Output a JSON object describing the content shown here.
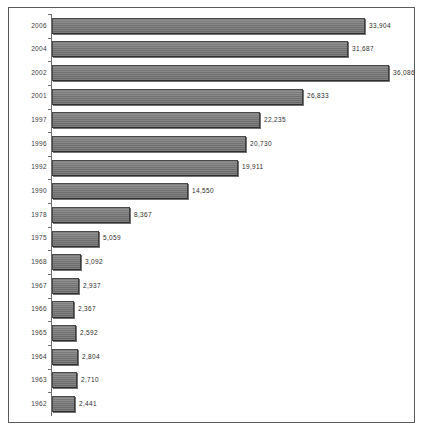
{
  "chart": {
    "type": "bar",
    "orientation": "horizontal",
    "title": "",
    "xlabel": "",
    "ylabel": "",
    "grid": false,
    "legend": false,
    "axis_tick_labels_visible": false,
    "bar_color": "#7a7a7a",
    "bar_border_color": "#4a4a4a",
    "frame_color": "#5a5a5a",
    "text_color": "#3b3b3b"
  },
  "chart_data": {
    "type": "bar",
    "orientation": "horizontal",
    "title": "",
    "xlabel": "",
    "ylabel": "",
    "grid": false,
    "legend_position": "none",
    "xlim": [
      0,
      36086
    ],
    "categories": [
      "2006",
      "2004",
      "2002",
      "2001",
      "1997",
      "1996",
      "1992",
      "1990",
      "1978",
      "1975",
      "1968",
      "1967",
      "1966",
      "1965",
      "1964",
      "1963",
      "1962"
    ],
    "values": [
      33904,
      31687,
      36086,
      26833,
      22235,
      20730,
      19911,
      14550,
      8367,
      5059,
      3092,
      2937,
      2367,
      2592,
      2804,
      2710,
      2441
    ],
    "value_labels": [
      "33,904",
      "31,687",
      "36,086",
      "26,833",
      "22,235",
      "20,730",
      "19,911",
      "14,550",
      "8,367",
      "5,059",
      "3,092",
      "2,937",
      "2,367",
      "2,592",
      "2,804",
      "2,710",
      "2,441"
    ],
    "bar_lengths_px": [
      313,
      296,
      337,
      251,
      208,
      194,
      186,
      136,
      78,
      47,
      29,
      27,
      22,
      24,
      26,
      25,
      23
    ]
  },
  "rows": [
    {
      "year": "2006",
      "value": 33904,
      "label": "33,904",
      "length_px": 313
    },
    {
      "year": "2004",
      "value": 31687,
      "label": "31,687",
      "length_px": 296
    },
    {
      "year": "2002",
      "value": 36086,
      "label": "36,086",
      "length_px": 337
    },
    {
      "year": "2001",
      "value": 26833,
      "label": "26,833",
      "length_px": 251
    },
    {
      "year": "1997",
      "value": 22235,
      "label": "22,235",
      "length_px": 208
    },
    {
      "year": "1996",
      "value": 20730,
      "label": "20,730",
      "length_px": 194
    },
    {
      "year": "1992",
      "value": 19911,
      "label": "19,911",
      "length_px": 186
    },
    {
      "year": "1990",
      "value": 14550,
      "label": "14,550",
      "length_px": 136
    },
    {
      "year": "1978",
      "value": 8367,
      "label": "8,367",
      "length_px": 78
    },
    {
      "year": "1975",
      "value": 5059,
      "label": "5,059",
      "length_px": 47
    },
    {
      "year": "1968",
      "value": 3092,
      "label": "3,092",
      "length_px": 29
    },
    {
      "year": "1967",
      "value": 2937,
      "label": "2,937",
      "length_px": 27
    },
    {
      "year": "1966",
      "value": 2367,
      "label": "2,367",
      "length_px": 22
    },
    {
      "year": "1965",
      "value": 2592,
      "label": "2,592",
      "length_px": 24
    },
    {
      "year": "1964",
      "value": 2804,
      "label": "2,804",
      "length_px": 26
    },
    {
      "year": "1963",
      "value": 2710,
      "label": "2,710",
      "length_px": 25
    },
    {
      "year": "1962",
      "value": 2441,
      "label": "2,441",
      "length_px": 23
    }
  ]
}
